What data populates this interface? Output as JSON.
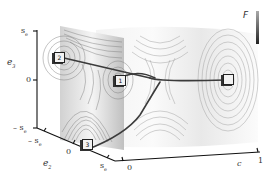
{
  "figure": {
    "colorbar": {
      "label": "F"
    },
    "axes": {
      "e3": {
        "label": "e3",
        "label_main": "e",
        "label_sub": "3",
        "ticks": [
          "s_e",
          "0",
          "-s_e"
        ]
      },
      "e2": {
        "label": "e2",
        "label_main": "e",
        "label_sub": "2",
        "ticks": [
          "-s_e",
          "0",
          "s_e"
        ]
      },
      "c": {
        "label": "c",
        "ticks": [
          "0",
          "1"
        ]
      }
    },
    "states": [
      {
        "id": "1",
        "label": "1"
      },
      {
        "id": "2",
        "label": "2"
      },
      {
        "id": "3",
        "label": "3"
      },
      {
        "id": "4",
        "label": ""
      }
    ],
    "tick_labels": {
      "e3_top_main": "s",
      "e3_top_sub": "e",
      "e3_zero": "0",
      "e3_bot_main": "– s",
      "e3_bot_sub": "e",
      "e2_left_main": "– s",
      "e2_left_sub": "e",
      "e2_zero": "0",
      "e2_right_main": "s",
      "e2_right_sub": "e",
      "c_zero": "0",
      "c_one": "1"
    }
  }
}
